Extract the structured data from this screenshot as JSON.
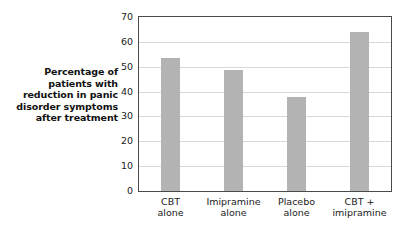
{
  "chart_data": {
    "type": "bar",
    "title": "",
    "xlabel": "",
    "ylabel": "Percentage of patients with reduction in panic disorder symptoms after treatment",
    "ylabel_lines": [
      "Percentage of",
      "patients with",
      "reduction in panic",
      "disorder symptoms",
      "after treatment"
    ],
    "categories": [
      "CBT alone",
      "Imipramine alone",
      "Placebo alone",
      "CBT + imipramine"
    ],
    "category_lines": [
      [
        "CBT",
        "alone"
      ],
      [
        "Imipramine",
        "alone"
      ],
      [
        "Placebo",
        "alone"
      ],
      [
        "CBT +",
        "imipramine"
      ]
    ],
    "values": [
      53.5,
      48.5,
      38,
      64
    ],
    "ylim": [
      0,
      70
    ],
    "yticks": [
      0,
      10,
      20,
      30,
      40,
      50,
      60,
      70
    ],
    "ytick_labels": [
      "0",
      "10",
      "20",
      "30",
      "40",
      "50",
      "60",
      "70"
    ],
    "grid": true,
    "legend": null,
    "colors": {
      "bar_fill": "#b3b3b3",
      "gridline": "#d8d8d8",
      "axis_border": "#4a4a4a",
      "text": "#1a1a1a",
      "background": "#ffffff"
    }
  }
}
